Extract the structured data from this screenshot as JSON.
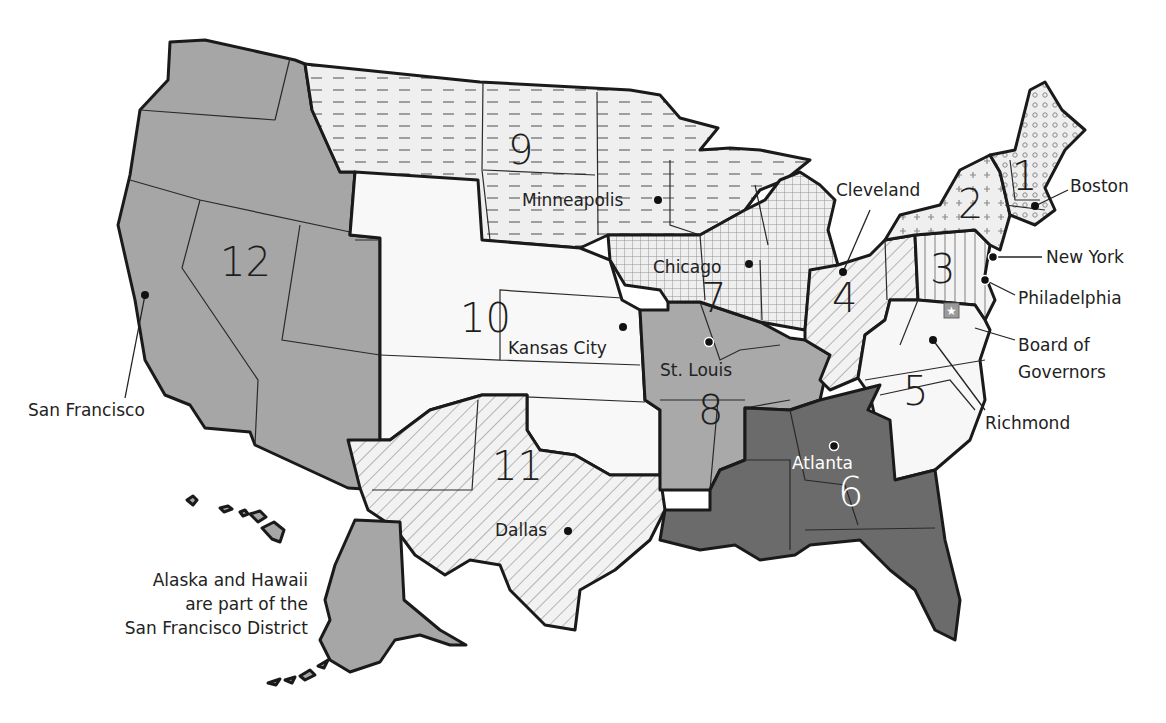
{
  "map": {
    "title": "Federal Reserve Districts",
    "districts": [
      {
        "number": "1",
        "city": "Boston",
        "pattern": "circles",
        "fill": "#efefef"
      },
      {
        "number": "2",
        "city": "New York",
        "pattern": "plus",
        "fill": "#efefef"
      },
      {
        "number": "3",
        "city": "Philadelphia",
        "pattern": "vertical-lines",
        "fill": "#f4f4f4"
      },
      {
        "number": "4",
        "city": "Cleveland",
        "pattern": "diagonal-lines",
        "fill": "#f2f2f2"
      },
      {
        "number": "5",
        "city": "Richmond",
        "pattern": "none",
        "fill": "#f7f7f7"
      },
      {
        "number": "6",
        "city": "Atlanta",
        "pattern": "none",
        "fill": "#6b6b6b"
      },
      {
        "number": "7",
        "city": "Chicago",
        "pattern": "grid",
        "fill": "#efefef"
      },
      {
        "number": "8",
        "city": "St. Louis",
        "pattern": "none",
        "fill": "#a9a9a9"
      },
      {
        "number": "9",
        "city": "Minneapolis",
        "pattern": "dashes",
        "fill": "#efefef"
      },
      {
        "number": "10",
        "city": "Kansas City",
        "pattern": "none",
        "fill": "#f8f8f8"
      },
      {
        "number": "11",
        "city": "Dallas",
        "pattern": "diagonal-lines",
        "fill": "#f2f2f2"
      },
      {
        "number": "12",
        "city": "San Francisco",
        "pattern": "none",
        "fill": "#a6a6a6"
      }
    ],
    "board": {
      "label_line1": "Board of",
      "label_line2": "Governors",
      "icon": "star-icon"
    },
    "note": {
      "line1": "Alaska and Hawaii",
      "line2": "are part of the",
      "line3": "San Francisco District"
    },
    "colors": {
      "outline": "#1a1a1a",
      "dark_gray": "#6b6b6b",
      "mid_gray": "#a6a6a6",
      "light": "#f2f2f2",
      "star_box": "#9a9a9a"
    }
  }
}
